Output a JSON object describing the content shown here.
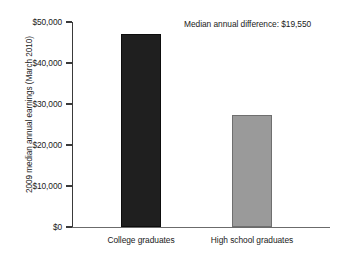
{
  "chart_data": {
    "type": "bar",
    "title": "",
    "subtitle": "",
    "xlabel": "",
    "ylabel": "2009 median annual earnings (March 2010)",
    "categories": [
      "College graduates",
      "High school graduates"
    ],
    "values": [
      47100,
      27300
    ],
    "bar_colors": [
      "#1f1f1f",
      "#9a9a9a"
    ],
    "ylim": [
      0,
      50000
    ],
    "ytick_values": [
      0,
      10000,
      20000,
      30000,
      40000,
      50000
    ],
    "ytick_labels": [
      "$0",
      "$10,000",
      "$20,000",
      "$30,000",
      "$40,000",
      "$50,000"
    ],
    "grid": false,
    "legend": "none",
    "annotations": [
      {
        "name": "median-difference-note",
        "text": "Median annual difference: $19,550",
        "value": 19550
      }
    ]
  },
  "axis": {
    "y_title": "2009 median annual earnings (March 2010)"
  },
  "colors": {
    "bar_dark": "#1f1f1f",
    "bar_gray": "#9a9a9a",
    "axis": "#3a3a3a",
    "text": "#1a1a1a",
    "background": "#ffffff"
  }
}
